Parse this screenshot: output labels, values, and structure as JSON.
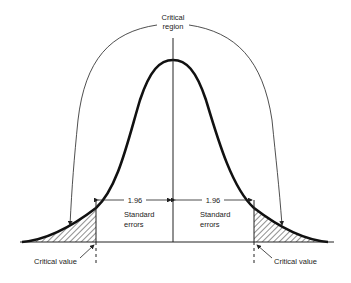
{
  "diagram": {
    "title_label": {
      "line1": "Critical",
      "line2": "region"
    },
    "left_interval": {
      "value": "1.96",
      "line1": "Standard",
      "line2": "errors"
    },
    "right_interval": {
      "value": "1.96",
      "line1": "Standard",
      "line2": "errors"
    },
    "left_critical_label": "Critical value",
    "right_critical_label": "Critical value",
    "colors": {
      "ink": "#1a1a1a",
      "background": "#ffffff"
    }
  }
}
